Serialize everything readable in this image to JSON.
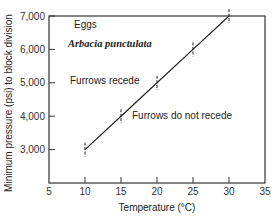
{
  "chart_data": {
    "type": "line",
    "title": "",
    "xlabel": "Temperature (°C)",
    "ylabel": "Minimum pressure (psi) to block division",
    "xlim": [
      5,
      35
    ],
    "ylim": [
      2000,
      7000
    ],
    "x_ticks": [
      5,
      10,
      15,
      20,
      25,
      30,
      35
    ],
    "x_tick_labels": [
      "5",
      "10",
      "15",
      "20",
      "25",
      "30",
      "35"
    ],
    "y_ticks": [
      3000,
      4000,
      5000,
      6000,
      7000
    ],
    "y_tick_labels": [
      "3,000",
      "4,000",
      "5,000",
      "6,000",
      "7,000"
    ],
    "grid": false,
    "legend": null,
    "series": [
      {
        "name": "Arbacia punctulata eggs",
        "x": [
          10,
          15,
          20,
          25,
          30
        ],
        "values": [
          3000,
          4000,
          5000,
          6000,
          7000
        ],
        "error_bars": true,
        "color": "#222222"
      }
    ],
    "annotations": [
      {
        "text": "Eggs",
        "x": 10,
        "y": 6850
      },
      {
        "text": "Arbacia punctulata",
        "x": 10,
        "y": 6200,
        "style": "italic"
      },
      {
        "text": "Furrows recede",
        "x": 10,
        "y": 5000
      },
      {
        "text": "Furrows do not recede",
        "x": 17,
        "y": 3950
      }
    ]
  },
  "labels": {
    "xlabel": "Temperature (°C)",
    "ylabel": "Minimum pressure (psi) to block division",
    "annot_eggs": "Eggs",
    "annot_species": "Arbacia punctulata",
    "annot_recede": "Furrows recede",
    "annot_not_recede": "Furrows do not recede"
  }
}
